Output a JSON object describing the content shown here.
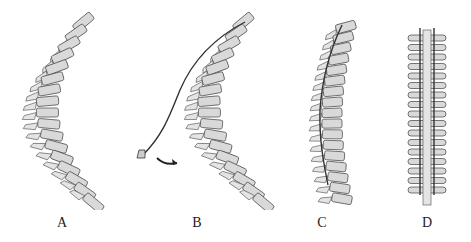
{
  "figure": {
    "panels": [
      {
        "id": "A",
        "label": "A",
        "description": "spine with curvature, no instrumentation"
      },
      {
        "id": "B",
        "label": "B",
        "description": "curved spine with rod attached at top, rod rotating (arrow)"
      },
      {
        "id": "C",
        "label": "C",
        "description": "spine partially straightened with rod along curve"
      },
      {
        "id": "D",
        "label": "D",
        "description": "posterior view of straightened spine with two rods"
      }
    ],
    "colors": {
      "bone_fill": "#d9d9d9",
      "outline": "#555555",
      "rod": "#333333",
      "background": "#ffffff"
    }
  }
}
